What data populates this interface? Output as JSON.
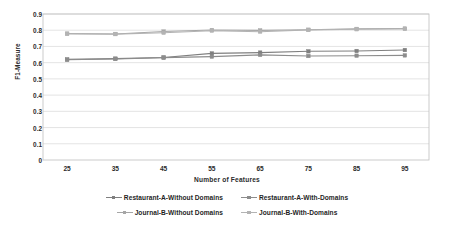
{
  "chart_data": {
    "type": "line",
    "title": "",
    "xlabel": "Number of Features",
    "ylabel": "F1-Measure",
    "categories": [
      25,
      35,
      45,
      55,
      65,
      75,
      85,
      95
    ],
    "x": [
      25,
      35,
      45,
      55,
      65,
      75,
      85,
      95
    ],
    "xtick_labels": [
      "25",
      "35",
      "45",
      "55",
      "65",
      "75",
      "85",
      "95"
    ],
    "ytick_labels": [
      "0.9",
      "0.8",
      "0.7",
      "0.6",
      "0.5",
      "0.4",
      "0.3",
      "0.2",
      "0.1",
      "0"
    ],
    "yticks": [
      0.9,
      0.8,
      0.7,
      0.6,
      0.5,
      0.4,
      0.3,
      0.2,
      0.1,
      0
    ],
    "ylim": [
      0,
      0.9
    ],
    "xlim": [
      20,
      100
    ],
    "grid": "horizontal",
    "legend_position": "bottom",
    "plot_border": true,
    "series": [
      {
        "name": "Restaurant-A-Without Domains",
        "color": "#7f7f7f",
        "marker": "square",
        "values": [
          0.62,
          0.625,
          0.632,
          0.657,
          0.662,
          0.67,
          0.672,
          0.678
        ]
      },
      {
        "name": "Restaurant-A-With-Domains",
        "color": "#8c8c8c",
        "marker": "square",
        "values": [
          0.618,
          0.623,
          0.631,
          0.637,
          0.648,
          0.641,
          0.643,
          0.645
        ]
      },
      {
        "name": "Journal-B-Without Domains",
        "color": "#a6a6a6",
        "marker": "square",
        "values": [
          0.779,
          0.777,
          0.792,
          0.801,
          0.799,
          0.803,
          0.808,
          0.81
        ]
      },
      {
        "name": "Journal-B-With-Domains",
        "color": "#b3b3b3",
        "marker": "square",
        "values": [
          0.778,
          0.776,
          0.784,
          0.797,
          0.791,
          0.802,
          0.806,
          0.809
        ]
      }
    ]
  },
  "legend": {
    "row1": [
      "Restaurant-A-Without Domains",
      "Restaurant-A-With-Domains"
    ],
    "row2": [
      "Journal-B-Without Domains",
      "Journal-B-With-Domains"
    ]
  },
  "colors": {
    "plot_background": "#ffffff",
    "grid_line": "#d9d9d9",
    "plot_border": "#bfbfbf",
    "text": "#1f1f1f"
  }
}
